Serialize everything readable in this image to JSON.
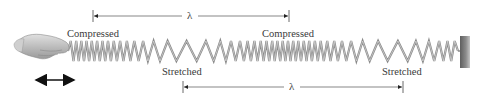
{
  "diagram": {
    "type": "longitudinal-wave-on-spring",
    "labels": {
      "compressed_left": "Compressed",
      "compressed_right": "Compressed",
      "stretched_left": "Stretched",
      "stretched_right": "Stretched"
    },
    "wavelength_top": {
      "symbol": "λ",
      "x_start": 93,
      "x_end": 289,
      "y": 16
    },
    "wavelength_bottom": {
      "symbol": "λ",
      "x_start": 183,
      "x_end": 403,
      "y": 87
    },
    "spring": {
      "x_start": 68,
      "x_end": 458,
      "y_center": 51,
      "amplitude": 10,
      "coil_count": 46,
      "compression_centers": [
        85,
        290
      ],
      "stretch_centers": [
        185,
        405
      ],
      "color": "#8a8a8a",
      "highlight": "#d8d8d8"
    },
    "wall": {
      "x": 460,
      "y": 36,
      "width": 10,
      "height": 32,
      "color": "#7a7a7a"
    },
    "hand": {
      "description": "hand holding spring end",
      "color": "#bdbdbd"
    },
    "motion_arrow": {
      "description": "double-headed arrow indicating back-and-forth motion",
      "x_start": 33,
      "x_end": 76,
      "y": 80
    }
  }
}
